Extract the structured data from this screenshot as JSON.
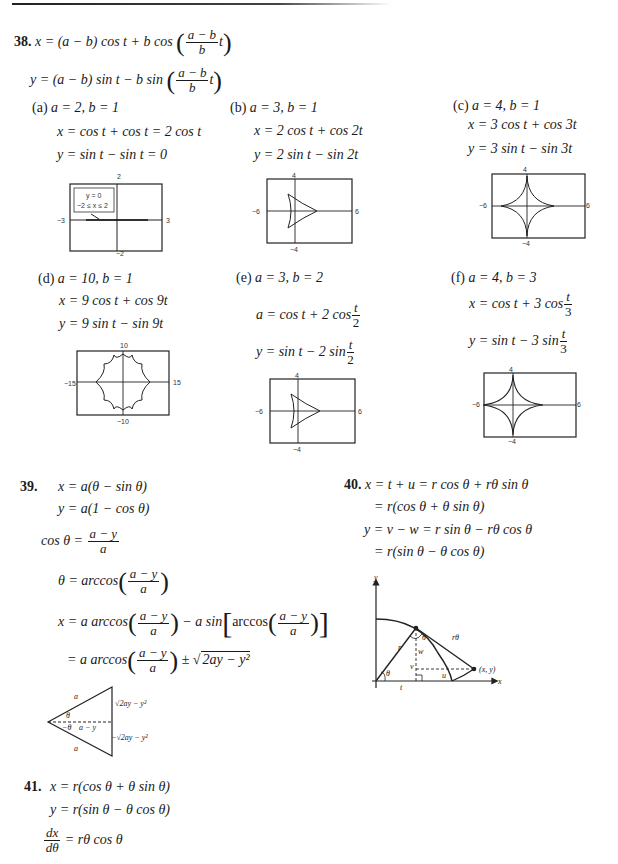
{
  "problem38": {
    "number": "38.",
    "eq_x": {
      "lhs": "x = (a − b) cos t + b cos",
      "frac_top": "a − b",
      "frac_bot": "b",
      "tail": "t"
    },
    "eq_y": {
      "lhs": "y = (a − b) sin t − b sin",
      "frac_top": "a − b",
      "frac_bot": "b",
      "tail": "t"
    },
    "parts": [
      {
        "label": "(a)",
        "params": "a = 2, b = 1",
        "x": "x = cos t + cos t = 2 cos t",
        "y": "y = sin t − sin t = 0",
        "graph": {
          "ymax": "2",
          "ymin": "−2",
          "xmin": "−3",
          "xmax": "3",
          "note_line1": "y = 0",
          "note_line2": "−2 ≤ x ≤ 2"
        }
      },
      {
        "label": "(b)",
        "params": "a = 3, b = 1",
        "x": "x = 2 cos t + cos 2t",
        "y": "y = 2 sin t − sin 2t",
        "graph": {
          "ymax": "4",
          "ymin": "−4",
          "xmin": "−6",
          "xmax": "6"
        }
      },
      {
        "label": "(c)",
        "params": "a = 4, b = 1",
        "x": "x = 3 cos t + cos 3t",
        "y": "y = 3 sin t − sin 3t",
        "graph": {
          "ymax": "4",
          "ymin": "−4",
          "xmin": "−6",
          "xmax": "6"
        }
      },
      {
        "label": "(d)",
        "params": "a = 10, b = 1",
        "x": "x = 9 cos t + cos 9t",
        "y": "y = 9 sin t − sin 9t",
        "graph": {
          "ymax": "10",
          "ymin": "−10",
          "xmin": "−15",
          "xmax": "15"
        }
      },
      {
        "label": "(e)",
        "params": "a = 3, b = 2",
        "x_lhs": "a = cos t + 2 cos",
        "x_frac_top": "t",
        "x_frac_bot": "2",
        "y_lhs": "y = sin t − 2 sin",
        "y_frac_top": "t",
        "y_frac_bot": "2",
        "graph": {
          "ymax": "4",
          "ymin": "−4",
          "xmin": "−6",
          "xmax": "6"
        }
      },
      {
        "label": "(f)",
        "params": "a = 4, b = 3",
        "x_lhs": "x = cos t + 3 cos",
        "x_frac_top": "t",
        "x_frac_bot": "3",
        "y_lhs": "y = sin t − 3 sin",
        "y_frac_top": "t",
        "y_frac_bot": "3",
        "graph": {
          "ymax": "4",
          "ymin": "−4",
          "xmin": "−6",
          "xmax": "6"
        }
      }
    ]
  },
  "problem39": {
    "number": "39.",
    "line1": "x = a(θ − sin θ)",
    "line2": "y = a(1 − cos θ)",
    "line3_lhs": "cos θ =",
    "frac_top": "a − y",
    "frac_bot": "a",
    "line4_lhs": "θ = arccos",
    "line5_lhs": "x = a arccos",
    "line5_mid": "− a sin",
    "line5_inner": "arccos",
    "line6_lhs": "= a arccos",
    "line6_pm": "±",
    "line6_sqrt": "2ay − y²",
    "triangle": {
      "side_top": "a",
      "side_bottom": "a",
      "angle_top": "θ",
      "angle_bottom": "−θ",
      "adjacent": "a − y",
      "opp_top": "√2ay − y²",
      "opp_bottom": "−√2ay − y²"
    }
  },
  "problem40": {
    "number": "40.",
    "line1": "x = t + u = r cos θ + rθ sin θ",
    "line2": "= r(cos θ + θ sin θ)",
    "line3": "y = v − w = r sin θ − rθ cos θ",
    "line4": "= r(sin θ − θ cos θ)",
    "diagram": {
      "y_axis": "y",
      "x_axis": "x",
      "r": "r",
      "theta": "θ",
      "theta2": "θ",
      "rtheta": "rθ",
      "w": "w",
      "v": "v",
      "u": "u",
      "t": "t",
      "point": "(x, y)"
    }
  },
  "problem41": {
    "number": "41.",
    "line1": "x = r(cos θ + θ sin θ)",
    "line2": "y = r(sin θ − θ cos θ)",
    "deriv_top": "dx",
    "deriv_bot": "dθ",
    "deriv_rhs": "= rθ cos θ"
  }
}
